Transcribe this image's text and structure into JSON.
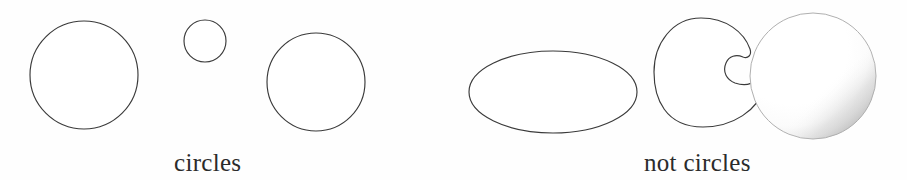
{
  "figure": {
    "background_color": "#fefefe",
    "stroke_color": "#3a3a3a",
    "fill_color": "#ffffff",
    "width": 907,
    "height": 180
  },
  "groups": [
    {
      "id": "circles",
      "caption": "circles",
      "caption_x": 174,
      "caption_y": 150,
      "shapes": [
        {
          "name": "large-circle",
          "type": "circle",
          "cx": 84,
          "cy": 75,
          "r": 54,
          "shaded": false
        },
        {
          "name": "small-circle",
          "type": "circle",
          "cx": 205,
          "cy": 41,
          "r": 21,
          "shaded": false
        },
        {
          "name": "medium-circle",
          "type": "circle",
          "cx": 316,
          "cy": 82,
          "r": 49,
          "shaded": false
        }
      ]
    },
    {
      "id": "not-circles",
      "caption": "not circles",
      "caption_x": 644,
      "caption_y": 150,
      "shapes": [
        {
          "name": "ellipse",
          "type": "ellipse",
          "cx": 553,
          "cy": 92,
          "rx": 84,
          "ry": 41,
          "shaded": false
        },
        {
          "name": "bean-shape",
          "type": "bean",
          "cx": 700,
          "cy": 72,
          "rx": 46,
          "ry": 55,
          "shaded": false
        },
        {
          "name": "shaded-sphere",
          "type": "circle",
          "cx": 813,
          "cy": 76,
          "r": 63,
          "shaded": true
        }
      ]
    }
  ],
  "legend": {
    "left_label": "circles",
    "right_label": "not circles"
  }
}
